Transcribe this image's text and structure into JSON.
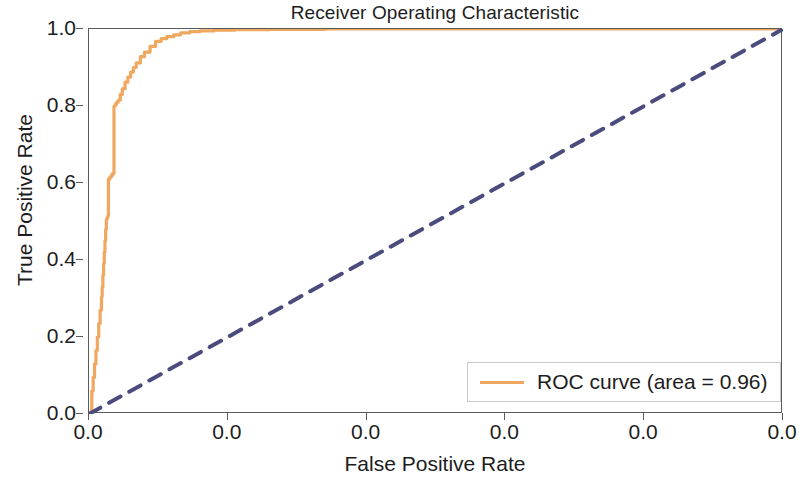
{
  "chart_data": {
    "type": "line",
    "title": "Receiver Operating Characteristic",
    "xlabel": "False Positive Rate",
    "ylabel": "True Positive Rate",
    "xlim": [
      0.0,
      1.0
    ],
    "ylim": [
      0.0,
      1.0
    ],
    "grid": false,
    "legend_position": "lower right",
    "x_tick_labels": [
      "0.0",
      "0.0",
      "0.0",
      "0.0",
      "0.0",
      "0.0"
    ],
    "x_tick_positions": [
      0.0,
      0.2,
      0.4,
      0.6,
      0.8,
      1.0
    ],
    "y_tick_labels": [
      "0.0",
      "0.2",
      "0.4",
      "0.6",
      "0.8",
      "1.0"
    ],
    "y_tick_positions": [
      0.0,
      0.2,
      0.4,
      0.6,
      0.8,
      1.0
    ],
    "series": [
      {
        "name": "ROC curve (area = 0.96)",
        "color": "#f0a860",
        "linestyle": "solid",
        "linewidth": 3.2,
        "drawstyle": "steps-post",
        "area": 0.96,
        "x": [
          0.0,
          0.004,
          0.006,
          0.008,
          0.01,
          0.012,
          0.014,
          0.016,
          0.018,
          0.019,
          0.02,
          0.021,
          0.022,
          0.023,
          0.024,
          0.025,
          0.026,
          0.027,
          0.028,
          0.03,
          0.032,
          0.034,
          0.036,
          0.038,
          0.04,
          0.042,
          0.045,
          0.048,
          0.052,
          0.056,
          0.06,
          0.064,
          0.068,
          0.074,
          0.08,
          0.088,
          0.096,
          0.104,
          0.112,
          0.122,
          0.132,
          0.145,
          0.16,
          0.18,
          0.21,
          0.26,
          0.34,
          0.45,
          0.6,
          0.8,
          1.0
        ],
        "y": [
          0.0,
          0.06,
          0.095,
          0.13,
          0.165,
          0.2,
          0.235,
          0.27,
          0.305,
          0.33,
          0.36,
          0.39,
          0.42,
          0.45,
          0.48,
          0.505,
          0.51,
          0.515,
          0.61,
          0.615,
          0.62,
          0.625,
          0.8,
          0.805,
          0.81,
          0.815,
          0.83,
          0.845,
          0.862,
          0.875,
          0.888,
          0.9,
          0.912,
          0.928,
          0.94,
          0.955,
          0.968,
          0.975,
          0.98,
          0.985,
          0.99,
          0.993,
          0.995,
          0.997,
          0.998,
          0.999,
          1.0,
          1.0,
          1.0,
          1.0,
          1.0
        ]
      },
      {
        "name": "chance-diagonal",
        "color": "#4b4b7d",
        "linestyle": "dashed",
        "linewidth": 4.0,
        "x": [
          0.0,
          1.0
        ],
        "y": [
          0.0,
          1.0
        ]
      }
    ],
    "legend_entries": [
      {
        "label": "ROC curve (area = 0.96)",
        "color": "#f0a860",
        "linestyle": "solid"
      }
    ]
  },
  "colors": {
    "roc_curve": "#f0a860",
    "chance_line": "#4b4b7d",
    "axis": "#5a5a5a",
    "text": "#1d1d1d",
    "background": "#ffffff"
  }
}
